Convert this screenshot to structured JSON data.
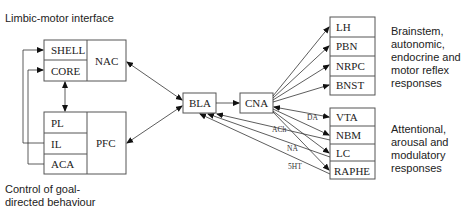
{
  "captions": {
    "limbic_motor": "Limbic-motor interface",
    "goal_directed": [
      "Control of goal-",
      "directed behaviour"
    ],
    "brainstem": [
      "Brainstem,",
      "autonomic,",
      "endocrine and",
      "motor reflex",
      "responses"
    ],
    "attentional": [
      "Attentional,",
      "arousal and",
      "modulatory",
      "responses"
    ]
  },
  "nodes": {
    "shell": "SHELL",
    "core": "CORE",
    "nac": "NAC",
    "pl": "PL",
    "il": "IL",
    "aca": "ACA",
    "pfc": "PFC",
    "bla": "BLA",
    "cna": "CNA",
    "lh": "LH",
    "pbn": "PBN",
    "nrpc": "NRPC",
    "bnst": "BNST",
    "vta": "VTA",
    "nbm": "NBM",
    "lc": "LC",
    "raphe": "RAPHE"
  },
  "edge_labels": {
    "da": "DA",
    "ach": "ACh",
    "na": "NA",
    "5ht": "5HT"
  },
  "edges": [
    {
      "from": "NAC",
      "to": "BLA",
      "type": "bidirectional"
    },
    {
      "from": "PFC",
      "to": "BLA",
      "type": "bidirectional"
    },
    {
      "from": "CORE",
      "to": "PL",
      "type": "bidirectional"
    },
    {
      "from": "IL",
      "to": "SHELL",
      "type": "directed"
    },
    {
      "from": "ACA",
      "to": "CORE",
      "type": "directed"
    },
    {
      "from": "BLA",
      "to": "CNA",
      "type": "directed"
    },
    {
      "from": "CNA",
      "to": "LH",
      "type": "directed"
    },
    {
      "from": "CNA",
      "to": "PBN",
      "type": "directed"
    },
    {
      "from": "CNA",
      "to": "NRPC",
      "type": "directed"
    },
    {
      "from": "CNA",
      "to": "BNST",
      "type": "directed"
    },
    {
      "from": "CNA",
      "to": "VTA",
      "type": "bidirectional",
      "label": "DA"
    },
    {
      "from": "CNA",
      "to": "NBM",
      "type": "directed"
    },
    {
      "from": "CNA",
      "to": "LC",
      "type": "directed"
    },
    {
      "from": "CNA",
      "to": "RAPHE",
      "type": "directed"
    },
    {
      "from": "NBM",
      "to": "BLA",
      "type": "directed",
      "label": "ACh"
    },
    {
      "from": "LC",
      "to": "BLA",
      "type": "directed",
      "label": "NA"
    },
    {
      "from": "RAPHE",
      "to": "BLA",
      "type": "directed",
      "label": "5HT"
    }
  ]
}
